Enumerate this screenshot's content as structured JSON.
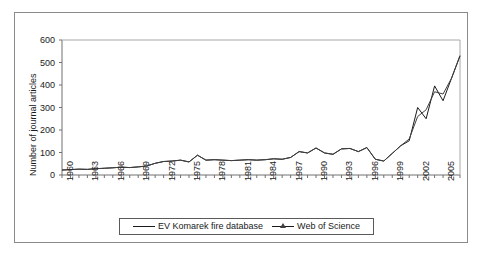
{
  "chart_data": {
    "type": "line",
    "title": "",
    "xlabel": "",
    "ylabel": "Number of journal articles",
    "xlim": [
      1960,
      2007
    ],
    "ylim": [
      0,
      600
    ],
    "yticks": [
      0,
      100,
      200,
      300,
      400,
      500,
      600
    ],
    "xticks": [
      1960,
      1963,
      1966,
      1969,
      1972,
      1975,
      1978,
      1981,
      1984,
      1987,
      1990,
      1993,
      1996,
      1999,
      2002,
      2005
    ],
    "x": [
      1960,
      1961,
      1962,
      1963,
      1964,
      1965,
      1966,
      1967,
      1968,
      1969,
      1970,
      1971,
      1972,
      1973,
      1974,
      1975,
      1976,
      1977,
      1978,
      1979,
      1980,
      1981,
      1982,
      1983,
      1984,
      1985,
      1986,
      1987,
      1988,
      1989,
      1990,
      1991,
      1992,
      1993,
      1994,
      1995,
      1996,
      1997,
      1998,
      1999,
      2000,
      2001,
      2002,
      2003,
      2004,
      2005,
      2006,
      2007
    ],
    "grid": false,
    "legend_position": "bottom",
    "series": [
      {
        "name": "EV Komarek fire database",
        "marker": "none",
        "color": "#1a1a1a",
        "values": [
          22,
          24,
          26,
          25,
          28,
          30,
          32,
          35,
          33,
          36,
          40,
          52,
          60,
          62,
          66,
          58,
          88,
          66,
          68,
          66,
          64,
          66,
          68,
          66,
          68,
          72,
          70,
          78,
          104,
          98,
          120,
          98,
          92,
          116,
          118,
          104,
          122,
          70,
          62,
          96,
          130,
          152,
          300,
          250,
          396,
          330,
          430,
          530
        ]
      },
      {
        "name": "Web of Science",
        "marker": "triangle",
        "color": "#404040",
        "values": [
          22,
          24,
          26,
          25,
          28,
          30,
          32,
          35,
          33,
          36,
          40,
          52,
          60,
          62,
          66,
          58,
          88,
          66,
          68,
          66,
          64,
          66,
          68,
          66,
          68,
          72,
          70,
          78,
          104,
          98,
          120,
          98,
          92,
          116,
          118,
          104,
          122,
          70,
          62,
          96,
          130,
          160,
          260,
          290,
          370,
          360,
          430,
          530
        ]
      }
    ]
  },
  "legend": {
    "entries": [
      {
        "label": "EV Komarek fire database"
      },
      {
        "label": "Web of Science"
      }
    ]
  }
}
